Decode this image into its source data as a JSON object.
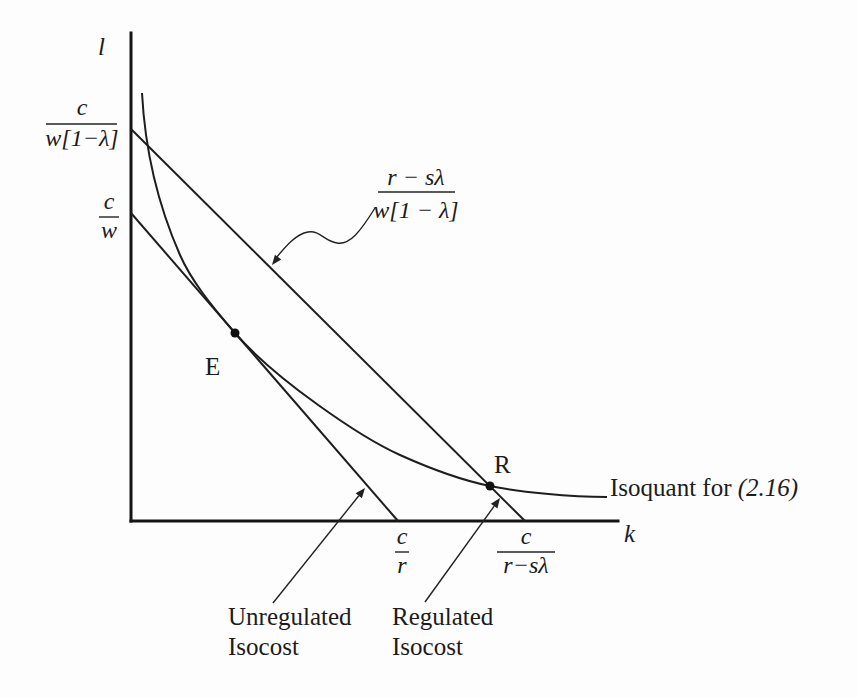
{
  "figure": {
    "axes": {
      "y_label": "l",
      "x_label": "k"
    },
    "y_ticks": [
      {
        "numerator": "c",
        "denominator": "w[1−λ]"
      },
      {
        "numerator": "c",
        "denominator": "w"
      }
    ],
    "x_ticks": [
      {
        "numerator": "c",
        "denominator": "r"
      },
      {
        "numerator": "c",
        "denominator": "r−sλ"
      }
    ],
    "slope_label": {
      "numerator": "r − sλ",
      "denominator": "w[1 − λ]"
    },
    "points": [
      {
        "label": "E"
      },
      {
        "label": "R"
      }
    ],
    "curves": {
      "isoquant_label": "Isoquant for ",
      "isoquant_ref": "(2.16)"
    },
    "annotations": [
      {
        "line1": "Unregulated",
        "line2": "Isocost"
      },
      {
        "line1": "Regulated",
        "line2": "Isocost"
      }
    ]
  }
}
